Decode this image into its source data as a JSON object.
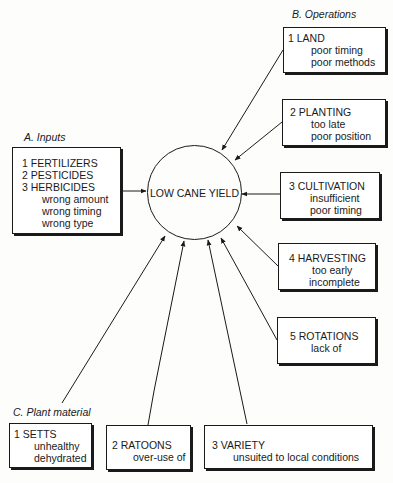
{
  "diagram": {
    "center": {
      "label": "LOW CANE YIELD"
    },
    "groups": {
      "inputs": {
        "title": "A. Inputs",
        "items": [
          {
            "head": "1  FERTILIZERS"
          },
          {
            "head": "2  PESTICIDES"
          },
          {
            "head": "3  HERBICIDES"
          }
        ],
        "subs": [
          "wrong amount",
          "wrong timing",
          "wrong type"
        ]
      },
      "operations": {
        "title": "B. Operations",
        "items": [
          {
            "head": "1  LAND",
            "subs": [
              "poor timing",
              "poor methods"
            ]
          },
          {
            "head": "2  PLANTING",
            "subs": [
              "too late",
              "poor position"
            ]
          },
          {
            "head": "3  CULTIVATION",
            "subs": [
              "insufficient",
              "poor timing"
            ]
          },
          {
            "head": "4  HARVESTING",
            "subs": [
              "too early",
              "incomplete"
            ]
          },
          {
            "head": "5  ROTATIONS",
            "subs": [
              "lack of"
            ]
          }
        ]
      },
      "plant_material": {
        "title": "C. Plant material",
        "items": [
          {
            "head": "1  SETTS",
            "subs": [
              "unhealthy",
              "dehydrated"
            ]
          },
          {
            "head": "2  RATOONS",
            "subs": [
              "over-use of"
            ]
          },
          {
            "head": "3  VARIETY",
            "subs": [
              "unsuited to local conditions"
            ]
          }
        ]
      }
    }
  }
}
